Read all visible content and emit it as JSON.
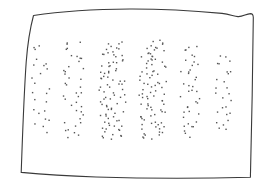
{
  "figure": {
    "caption": "",
    "canvas": {
      "width": 267,
      "height": 195,
      "background": "#ffffff"
    },
    "frame": {
      "name": "hand-drawn-rectangle-border",
      "stroke_color": "#3a3a3a",
      "stroke_width": 1.1,
      "fill": "none",
      "style": "freehand-wobbly",
      "corners": {
        "top_left": [
          33,
          15
        ],
        "top_right": [
          253,
          17
        ],
        "bottom_right": [
          250,
          177
        ],
        "bottom_left": [
          21,
          172
        ]
      },
      "path": "M33.5,15.5 C60,11.5 96,9.2 130,9.0 C163,8.9 196,11.0 222,13.4 C230,14.2 234,16.4 238,16.6 C243,16.9 246,13.8 250.5,13.6 C252.6,13.6 253.2,15.2 253.3,17.4 L252.2,95 L250.4,177.2 C214,178.2 150,178.6 96,177.0 C66,176.0 38,174.0 21.2,172.4 C22.4,140 23.6,100 26.2,62 C27.6,44 30.4,27 33.5,15.5 Z"
    },
    "dot_style": {
      "color": "#555555",
      "shape": "square",
      "size_px": 1.4
    },
    "bands": [
      {
        "name": "band-1",
        "label": "1",
        "center_x": 41,
        "width": 20,
        "top": 44,
        "bottom": 136,
        "count": 24,
        "density": "very-low"
      },
      {
        "name": "band-2",
        "label": "2",
        "center_x": 74,
        "width": 22,
        "top": 40,
        "bottom": 139,
        "count": 40,
        "density": "low"
      },
      {
        "name": "band-3",
        "label": "3",
        "center_x": 112,
        "width": 28,
        "top": 42,
        "bottom": 140,
        "count": 84,
        "density": "high"
      },
      {
        "name": "band-4",
        "label": "4",
        "center_x": 153,
        "width": 28,
        "top": 40,
        "bottom": 140,
        "count": 88,
        "density": "high"
      },
      {
        "name": "band-5",
        "label": "5",
        "center_x": 190,
        "width": 20,
        "top": 44,
        "bottom": 137,
        "count": 40,
        "density": "low"
      },
      {
        "name": "band-6",
        "label": "6",
        "center_x": 224,
        "width": 18,
        "top": 52,
        "bottom": 134,
        "count": 26,
        "density": "very-low"
      }
    ]
  },
  "chart_data": {
    "type": "scatter",
    "xlabel": "",
    "ylabel": "",
    "xlim": [
      21,
      253
    ],
    "ylim": [
      9,
      178
    ],
    "grid": false,
    "legend": "none",
    "categories": [
      "1",
      "2",
      "3",
      "4",
      "5",
      "6"
    ],
    "values": [
      24,
      40,
      84,
      88,
      40,
      26
    ],
    "series": [
      {
        "name": "dot-count-per-band",
        "values": [
          24,
          40,
          84,
          88,
          40,
          26
        ]
      }
    ],
    "annotations": []
  }
}
